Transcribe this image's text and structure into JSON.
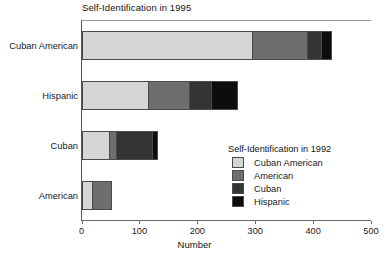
{
  "chart_data": {
    "type": "bar",
    "orientation": "horizontal",
    "stacked": true,
    "title": "Self-Identification in 1995",
    "xlabel": "Number",
    "ylabel": "",
    "xlim": [
      0,
      500
    ],
    "xticks": [
      0,
      100,
      200,
      300,
      400,
      500
    ],
    "xtick_labels": [
      "0",
      "100",
      "200",
      "300",
      "400",
      "500"
    ],
    "grid": false,
    "legend_position": "inside-right",
    "legend_title": "Self-Identification in 1992",
    "categories": [
      "Cuban American",
      "Hispanic",
      "Cuban",
      "American"
    ],
    "series": [
      {
        "name": "Cuban American",
        "color": "#d6d6d6",
        "values": [
          295,
          115,
          48,
          18
        ]
      },
      {
        "name": "American",
        "color": "#6e6e6e",
        "values": [
          95,
          70,
          12,
          34
        ]
      },
      {
        "name": "Cuban",
        "color": "#343434",
        "values": [
          23,
          38,
          62,
          0
        ]
      },
      {
        "name": "Hispanic",
        "color": "#0d0d0d",
        "values": [
          19,
          48,
          10,
          0
        ]
      }
    ],
    "totals": [
      432,
      271,
      132,
      52
    ]
  },
  "chart": {
    "title": "Self-Identification in 1995",
    "axis_title": "Number",
    "xticks": [
      {
        "label": "0",
        "value": 0
      },
      {
        "label": "100",
        "value": 100
      },
      {
        "label": "200",
        "value": 200
      },
      {
        "label": "300",
        "value": 300
      },
      {
        "label": "400",
        "value": 400
      },
      {
        "label": "500",
        "value": 500
      }
    ],
    "categories": [
      {
        "label": "Cuban American"
      },
      {
        "label": "Hispanic"
      },
      {
        "label": "Cuban"
      },
      {
        "label": "American"
      }
    ],
    "legend": {
      "title": "Self-Identification in 1992",
      "items": [
        {
          "label": "Cuban American",
          "color": "#d6d6d6"
        },
        {
          "label": "American",
          "color": "#6e6e6e"
        },
        {
          "label": "Cuban",
          "color": "#343434"
        },
        {
          "label": "Hispanic",
          "color": "#0d0d0d"
        }
      ]
    }
  }
}
